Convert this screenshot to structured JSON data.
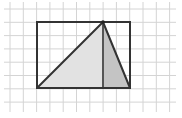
{
  "diagram": {
    "type": "geometry-grid",
    "grid": {
      "cell_size": 13.3,
      "origin_x": 10,
      "origin_y": 9,
      "columns": 13,
      "rows": 8,
      "line_color": "#d4d4d4"
    },
    "rectangle": {
      "x1": 37,
      "y1": 22,
      "x2": 130,
      "y2": 88,
      "width_cells": 7,
      "height_cells": 5,
      "stroke": "#333333"
    },
    "triangle": {
      "vertices": [
        [
          37,
          88
        ],
        [
          103,
          22
        ],
        [
          130,
          88
        ]
      ],
      "stroke": "#333333"
    },
    "altitude": {
      "x": 103,
      "y1": 22,
      "y2": 88,
      "stroke": "#555555"
    },
    "regions": [
      {
        "name": "left-part",
        "points": [
          [
            37,
            88
          ],
          [
            103,
            22
          ],
          [
            103,
            88
          ]
        ],
        "fill": "#e2e2e2"
      },
      {
        "name": "right-part",
        "points": [
          [
            103,
            22
          ],
          [
            130,
            88
          ],
          [
            103,
            88
          ]
        ],
        "fill": "#c4c4c4"
      }
    ]
  }
}
